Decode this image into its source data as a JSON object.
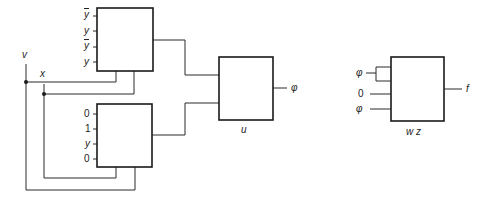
{
  "signals": {
    "v": "v",
    "x": "x"
  },
  "mux_top": {
    "inputs": [
      "y",
      "y",
      "y",
      "y"
    ],
    "inputs_complemented": [
      true,
      false,
      true,
      false
    ]
  },
  "mux_bottom": {
    "inputs": [
      "0",
      "1",
      "y",
      "0"
    ]
  },
  "mux_u": {
    "label": "u",
    "output": "φ"
  },
  "mux_wz": {
    "inputs": [
      "φ",
      "0",
      "φ"
    ],
    "label": "w z",
    "output": "f"
  }
}
